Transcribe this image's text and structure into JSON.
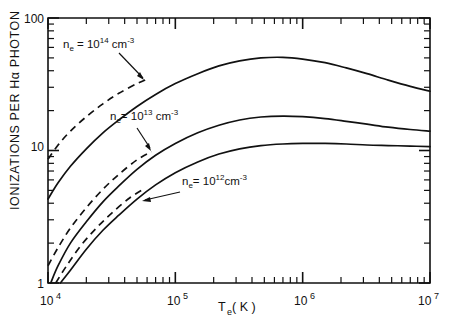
{
  "chart_data": {
    "type": "line",
    "title": "",
    "xlabel": "T_e (K)",
    "ylabel": "IONIZATIONS PER Hα PHOTON",
    "xscale": "log",
    "yscale": "log",
    "xlim": [
      10000,
      10000000
    ],
    "ylim": [
      1,
      100
    ],
    "grid": false,
    "legend_position": "inline-annotations",
    "xticklabels": [
      "10⁴",
      "10⁵",
      "10⁶",
      "10⁷"
    ],
    "xtickvalues": [
      10000,
      100000,
      1000000,
      10000000
    ],
    "yticklabels": [
      "1",
      "10",
      "100"
    ],
    "ytickvalues": [
      1,
      10,
      100
    ],
    "series": [
      {
        "name": "n_e = 10^14 cm^-3",
        "style": "solid",
        "x": [
          9000,
          10000,
          12000,
          15000,
          20000,
          27000,
          36000,
          50000,
          70000,
          100000,
          150000,
          220000,
          320000,
          470000,
          700000,
          1000000,
          1500000,
          2200000,
          3200000,
          4700000,
          7000000,
          10000000
        ],
        "y": [
          3.6,
          4.3,
          5.7,
          7.6,
          10.3,
          13.6,
          17.0,
          21.5,
          26.5,
          32.0,
          38.0,
          43.5,
          47.5,
          50.0,
          50.5,
          49.0,
          46.0,
          42.0,
          38.0,
          34.0,
          30.5,
          28.0
        ]
      },
      {
        "name": "n_e = 10^14 cm^-3 (low-density limit, dashed)",
        "style": "dashed",
        "x": [
          9000,
          10000,
          12000,
          15000,
          20000,
          27000,
          36000,
          50000,
          62000
        ],
        "y": [
          7.4,
          8.6,
          11.0,
          14.0,
          18.0,
          22.5,
          27.0,
          32.0,
          35.0
        ]
      },
      {
        "name": "n_e = 10^13 cm^-3",
        "style": "solid",
        "x": [
          10500,
          12000,
          15000,
          20000,
          27000,
          36000,
          50000,
          70000,
          100000,
          150000,
          220000,
          320000,
          470000,
          700000,
          1000000,
          1500000,
          2200000,
          3200000,
          4700000,
          7000000,
          10000000
        ],
        "y": [
          1.0,
          1.35,
          2.0,
          2.9,
          4.1,
          5.4,
          7.2,
          9.2,
          11.3,
          13.6,
          15.5,
          17.0,
          17.9,
          18.2,
          18.0,
          17.4,
          16.6,
          15.8,
          15.0,
          14.4,
          14.0
        ]
      },
      {
        "name": "n_e = 10^13 cm^-3 (low-density limit, dashed)",
        "style": "dashed",
        "x": [
          10000,
          12000,
          15000,
          20000,
          27000,
          36000,
          50000,
          65000
        ],
        "y": [
          1.35,
          1.85,
          2.6,
          3.7,
          5.1,
          6.6,
          8.5,
          9.8
        ]
      },
      {
        "name": "n_e = 10^12 cm^-3",
        "style": "solid",
        "x": [
          12500,
          15000,
          20000,
          27000,
          36000,
          50000,
          70000,
          100000,
          150000,
          220000,
          320000,
          470000,
          700000,
          1000000,
          1500000,
          2200000,
          3200000,
          4700000,
          7000000,
          10000000
        ],
        "y": [
          1.0,
          1.25,
          1.8,
          2.5,
          3.25,
          4.3,
          5.5,
          6.8,
          8.2,
          9.4,
          10.3,
          10.9,
          11.2,
          11.3,
          11.3,
          11.2,
          11.0,
          10.9,
          10.8,
          10.7
        ]
      },
      {
        "name": "n_e = 10^12 cm^-3 (low-density limit, dashed)",
        "style": "dashed",
        "x": [
          11500,
          14000,
          18000,
          24000,
          32000,
          44000,
          58000
        ],
        "y": [
          1.0,
          1.35,
          1.9,
          2.6,
          3.4,
          4.4,
          5.2
        ]
      }
    ],
    "annotations": [
      {
        "id": "ann-ne14",
        "text_parts": {
          "base": "n",
          "sub": "e",
          "eq": " = 10",
          "sup": "14",
          "unit": " cm",
          "unitsup": "-3"
        },
        "text": "n_e = 10^14 cm^-3"
      },
      {
        "id": "ann-ne13",
        "text_parts": {
          "base": "n",
          "sub": "e",
          "eq": "= 10",
          "sup": "13",
          "unit": " cm",
          "unitsup": "-3"
        },
        "text": "n_e = 10^13 cm^-3"
      },
      {
        "id": "ann-ne12",
        "text_parts": {
          "base": "n",
          "sub": "e",
          "eq": "= 10",
          "sup": "12",
          "unit": "cm",
          "unitsup": "-3"
        },
        "text": "n_e = 10^12 cm^-3"
      }
    ]
  },
  "axes": {
    "x_title_base": "T",
    "x_title_sub": "e",
    "x_title_unit": " ( K )",
    "y_title": "IONIZATIONS PER Hα PHOTON",
    "x_tick_10_4_mant": "10",
    "x_tick_10_4_exp": "4",
    "x_tick_10_5_mant": "10",
    "x_tick_10_5_exp": "5",
    "x_tick_10_6_mant": "10",
    "x_tick_10_6_exp": "6",
    "x_tick_10_7_mant": "10",
    "x_tick_10_7_exp": "7",
    "y_tick_1": "1",
    "y_tick_10": "10",
    "y_tick_100": "100"
  },
  "colors": {
    "ink": "#111111",
    "background": "#ffffff"
  }
}
